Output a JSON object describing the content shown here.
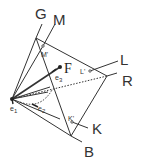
{
  "diagram": {
    "title": "",
    "labels": {
      "G": "G",
      "M": "M",
      "M_prime": "M'",
      "F": "F",
      "L": "L",
      "L_prime": "L'",
      "R": "R",
      "K": "K",
      "K_prime": "K'",
      "B": "B",
      "e1": "e",
      "e1_sub": "1",
      "e2": "e",
      "e2_sub": "2",
      "e3": "e",
      "e3_sub": "3"
    },
    "points": {
      "origin": [
        12,
        99
      ],
      "top_vertex": [
        36,
        38
      ],
      "right_vertex": [
        107,
        76
      ],
      "bottom_vertex": [
        71,
        136
      ],
      "M_prime": [
        43,
        46
      ],
      "F": [
        60,
        67
      ],
      "L_prime": [
        90,
        71
      ],
      "K_prime": [
        72,
        122
      ]
    },
    "colors": {
      "line": "#333333",
      "background": "#ffffff"
    }
  }
}
